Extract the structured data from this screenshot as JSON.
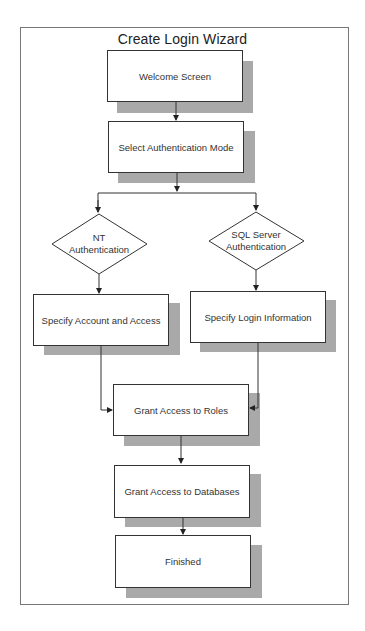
{
  "diagram": {
    "title": "Create Login Wizard",
    "type": "flowchart",
    "nodes": [
      {
        "id": "welcome",
        "shape": "box",
        "label": "Welcome Screen"
      },
      {
        "id": "select_mode",
        "shape": "box",
        "label": "Select Authentication Mode"
      },
      {
        "id": "nt_auth",
        "shape": "diamond",
        "label_line1": "NT",
        "label_line2": "Authentication"
      },
      {
        "id": "sql_auth",
        "shape": "diamond",
        "label_line1": "SQL Server",
        "label_line2": "Authentication"
      },
      {
        "id": "specify_account",
        "shape": "box",
        "label": "Specify Account and Access"
      },
      {
        "id": "specify_login",
        "shape": "box",
        "label": "Specify Login Information"
      },
      {
        "id": "grant_roles",
        "shape": "box",
        "label": "Grant Access to Roles"
      },
      {
        "id": "grant_db",
        "shape": "box",
        "label": "Grant Access to Databases"
      },
      {
        "id": "finished",
        "shape": "box",
        "label": "Finished"
      }
    ],
    "edges": [
      {
        "from": "welcome",
        "to": "select_mode"
      },
      {
        "from": "select_mode",
        "to": "nt_auth"
      },
      {
        "from": "select_mode",
        "to": "sql_auth"
      },
      {
        "from": "nt_auth",
        "to": "specify_account"
      },
      {
        "from": "sql_auth",
        "to": "specify_login"
      },
      {
        "from": "specify_account",
        "to": "grant_roles"
      },
      {
        "from": "specify_login",
        "to": "grant_roles"
      },
      {
        "from": "grant_roles",
        "to": "grant_db"
      },
      {
        "from": "grant_db",
        "to": "finished"
      }
    ],
    "colors": {
      "box_fill": "#ffffff",
      "box_border": "#333333",
      "shadow": "#a9a9a9",
      "frame_border": "#777777"
    }
  }
}
